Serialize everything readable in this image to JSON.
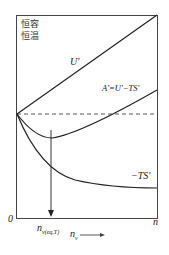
{
  "diagram": {
    "condition_line1": "恒容",
    "condition_line2": "恒温",
    "curves": {
      "U": "U'",
      "A": "A'=U'−TS'",
      "TS": "−TS'"
    },
    "axis": {
      "origin": "0",
      "x_end": "n",
      "equilibrium_marker": "n",
      "equilibrium_sub": "v(eq,T)",
      "x_label": "n",
      "x_label_sub": "v"
    }
  }
}
